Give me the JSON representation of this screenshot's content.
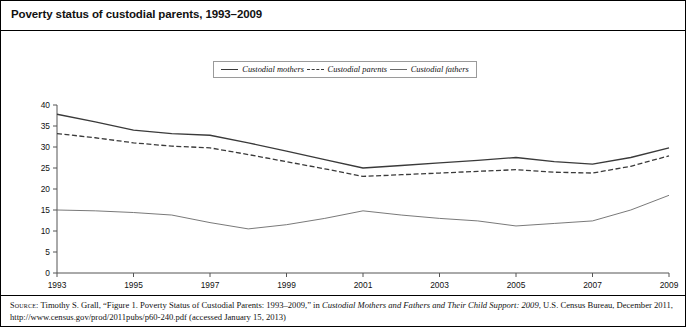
{
  "header": {
    "title": "Poverty status of custodial parents, 1993–2009"
  },
  "legend": {
    "position": "top-center",
    "items": [
      {
        "label": "Custodial mothers",
        "style": "solid",
        "color": "#3a3a3a"
      },
      {
        "label": "Custodial parents",
        "style": "dashed",
        "color": "#3a3a3a"
      },
      {
        "label": "Custodial fathers",
        "style": "solid-thin",
        "color": "#6a6a6a"
      }
    ]
  },
  "source": {
    "prefix": "Source:",
    "line1_a": " Timothy S. Grall, “Figure 1. Poverty Status of Custodial Parents: 1993–2009,” in ",
    "line1_italic": "Custodial Mothers and Fathers and Their Child Support: 2009",
    "line1_b": ",",
    "line2": "U.S. Census Bureau, December 2011, http://www.census.gov/prod/2011pubs/p60-240.pdf (accessed January 15, 2013)"
  },
  "chart_data": {
    "type": "line",
    "title": "Poverty status of custodial parents, 1993–2009",
    "xlabel": "",
    "ylabel": "Percent",
    "ylim": [
      0,
      40
    ],
    "yticks": [
      0,
      5,
      10,
      15,
      20,
      25,
      30,
      35,
      40
    ],
    "xlim": [
      1993,
      2009
    ],
    "xticks": [
      1993,
      1995,
      1997,
      1999,
      2001,
      2003,
      2005,
      2007,
      2009
    ],
    "xtick_labels": [
      "1993",
      "1995",
      "1997",
      "1999",
      "2001",
      "2003",
      "2005",
      "2007",
      "2009"
    ],
    "grid": false,
    "legend_position": "top-center",
    "x": [
      1993,
      1994,
      1995,
      1996,
      1997,
      1998,
      1999,
      2000,
      2001,
      2002,
      2003,
      2004,
      2005,
      2006,
      2007,
      2008,
      2009
    ],
    "series": [
      {
        "name": "Custodial mothers",
        "style": "solid",
        "color": "#3a3a3a",
        "values": [
          37.8,
          36.0,
          34.0,
          33.2,
          32.8,
          31.0,
          29.0,
          27.0,
          25.0,
          25.6,
          26.2,
          26.8,
          27.5,
          26.5,
          25.9,
          27.5,
          29.8
        ]
      },
      {
        "name": "Custodial parents",
        "style": "dashed",
        "color": "#3a3a3a",
        "values": [
          33.2,
          32.2,
          31.0,
          30.2,
          29.8,
          28.2,
          26.5,
          24.8,
          23.0,
          23.4,
          23.8,
          24.2,
          24.6,
          24.0,
          23.8,
          25.4,
          27.9
        ]
      },
      {
        "name": "Custodial fathers",
        "style": "solid-thin",
        "color": "#6a6a6a",
        "values": [
          15.0,
          14.8,
          14.4,
          13.8,
          12.0,
          10.5,
          11.5,
          13.0,
          14.8,
          13.8,
          13.0,
          12.4,
          11.2,
          11.8,
          12.4,
          15.0,
          18.5
        ]
      }
    ]
  }
}
